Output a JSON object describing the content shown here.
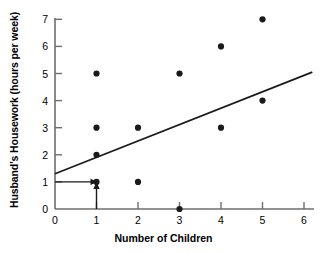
{
  "chart_data": {
    "type": "scatter",
    "title": "",
    "xlabel": "Number of Children",
    "ylabel": "Husband's Housework (hours per week)",
    "xlim": [
      0,
      6
    ],
    "ylim": [
      0,
      7
    ],
    "xticks": [
      0,
      1,
      2,
      3,
      4,
      5,
      6
    ],
    "yticks": [
      0,
      1,
      2,
      3,
      4,
      5,
      6,
      7
    ],
    "grid": false,
    "legend": "none",
    "points": [
      {
        "x": 1,
        "y": 5
      },
      {
        "x": 1,
        "y": 3
      },
      {
        "x": 1,
        "y": 2
      },
      {
        "x": 1,
        "y": 1
      },
      {
        "x": 2,
        "y": 3
      },
      {
        "x": 2,
        "y": 1
      },
      {
        "x": 3,
        "y": 5
      },
      {
        "x": 3,
        "y": 0
      },
      {
        "x": 4,
        "y": 6
      },
      {
        "x": 4,
        "y": 3
      },
      {
        "x": 5,
        "y": 7
      },
      {
        "x": 5,
        "y": 4
      }
    ],
    "regression_line": {
      "x_start": 0,
      "y_start": 1.3,
      "x_end": 6.2,
      "y_end": 5.05
    },
    "annotations": [
      {
        "name": "horizontal-arrow",
        "from_x": 0,
        "from_y": 1,
        "to_x": 1,
        "to_y": 1
      },
      {
        "name": "vertical-arrow",
        "from_x": 1,
        "from_y": 0,
        "to_x": 1,
        "to_y": 1
      }
    ],
    "colors": {
      "point": "#1a1a1a",
      "line": "#1a1a1a",
      "axis": "#6e6e6e",
      "text": "#000000",
      "background": "#ffffff"
    }
  },
  "axis": {
    "x_tick_labels": [
      "0",
      "1",
      "2",
      "3",
      "4",
      "5",
      "6"
    ],
    "y_tick_labels": [
      "0",
      "1",
      "2",
      "3",
      "4",
      "5",
      "6",
      "7"
    ],
    "x_title": "Number of Children",
    "y_title": "Husband's Housework (hours per week)"
  }
}
